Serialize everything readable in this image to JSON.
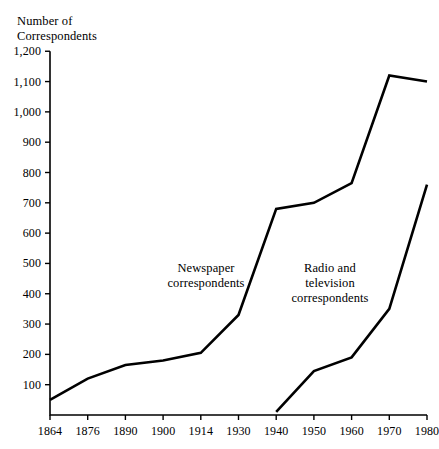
{
  "chart_data": {
    "type": "line",
    "title": "Number of\nCorrespondents",
    "ylabel": "Number of Correspondents",
    "xlabel": "",
    "x": [
      1864,
      1876,
      1890,
      1900,
      1914,
      1930,
      1940,
      1950,
      1960,
      1970,
      1980
    ],
    "xtick_labels": [
      "1864",
      "1876",
      "1890",
      "1900",
      "1914",
      "1930",
      "1940",
      "1950",
      "1960",
      "1970",
      "1980"
    ],
    "ytick_labels": [
      "100",
      "200",
      "300",
      "400",
      "500",
      "600",
      "700",
      "800",
      "900",
      "1,000",
      "1,100",
      "1,200"
    ],
    "ytick_values": [
      100,
      200,
      300,
      400,
      500,
      600,
      700,
      800,
      900,
      1000,
      1100,
      1200
    ],
    "ylim": [
      0,
      1200
    ],
    "grid": false,
    "legend_position": "inline-annotation",
    "series": [
      {
        "name": "Newspaper correspondents",
        "label_text": "Newspaper\ncorrespondents",
        "color": "#000000",
        "x": [
          1864,
          1876,
          1890,
          1900,
          1914,
          1930,
          1940,
          1950,
          1960,
          1970,
          1980
        ],
        "values": [
          50,
          120,
          165,
          180,
          205,
          330,
          680,
          700,
          765,
          1120,
          1100
        ]
      },
      {
        "name": "Radio and television correspondents",
        "label_text": "Radio and\ntelevision\ncorrespondents",
        "color": "#000000",
        "x": [
          1940,
          1950,
          1960,
          1970,
          1980
        ],
        "values": [
          10,
          145,
          190,
          350,
          760
        ]
      }
    ],
    "annotations": [
      {
        "text": "Newspaper\ncorrespondents",
        "x_px": 206,
        "y_px": 261
      },
      {
        "text": "Radio and\ntelevision\ncorrespondents",
        "x_px": 330,
        "y_px": 261
      }
    ],
    "axis_color": "#000000",
    "line_color": "#000000"
  }
}
